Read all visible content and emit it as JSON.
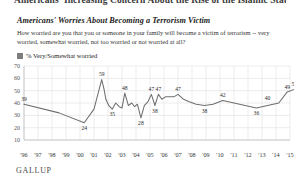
{
  "article": {
    "headline": "Americans' Increasing Concern About the Rise of the Islamic State"
  },
  "chart_header": {
    "title": "Americans' Worries About Becoming a Terrorism Victim",
    "subtitle": "How worried are you that you or someone in your family will become a victim of terrorism -- very worried, somewhat worried, not too worried or not worried at all?",
    "legend_label": "% Very/Somewhat worried",
    "legend_color": "#7d7d7d"
  },
  "footer": {
    "brand": "GALLUP"
  },
  "chart_data": {
    "type": "line",
    "title": "Americans' Worries About Becoming a Terrorism Victim",
    "subtitle": "How worried are you that you or someone in your family will become a victim of terrorism -- very worried, somewhat worried, not too worried or not worried at all?",
    "xlabel": "",
    "ylabel": "",
    "ylim": [
      10,
      70
    ],
    "yticks": [
      10,
      20,
      30,
      40,
      50,
      60,
      70
    ],
    "xlim": [
      1996,
      2015
    ],
    "xticks": [
      "'96",
      "'97",
      "'98",
      "'99",
      "'00",
      "'01",
      "'02",
      "'03",
      "'04",
      "'05",
      "'06",
      "'07",
      "'08",
      "'09",
      "'10",
      "'11",
      "'12",
      "'13",
      "'14",
      "'15"
    ],
    "grid": true,
    "legend_position": "top-left",
    "series": [
      {
        "name": "% Very/Somewhat worried",
        "color": "#6f6f6f",
        "x": [
          1996.0,
          1998.5,
          2000.3,
          2001.0,
          2001.55,
          2001.72,
          2001.85,
          2002.05,
          2002.3,
          2002.55,
          2002.8,
          2003.0,
          2003.2,
          2003.45,
          2003.7,
          2003.9,
          2004.1,
          2004.35,
          2004.6,
          2004.85,
          2005.1,
          2005.35,
          2005.6,
          2005.85,
          2006.1,
          2006.4,
          2006.7,
          2007.0,
          2007.4,
          2007.8,
          2008.3,
          2008.9,
          2009.5,
          2010.2,
          2011.0,
          2011.8,
          2012.6,
          2013.4,
          2014.2,
          2014.8,
          2015.3
        ],
        "values": [
          39,
          32,
          24,
          35,
          59,
          51,
          43,
          38,
          35,
          40,
          37,
          36,
          48,
          38,
          40,
          37,
          39,
          28,
          38,
          41,
          47,
          38,
          47,
          43,
          45,
          45,
          45,
          47,
          43,
          41,
          39,
          38,
          39,
          42,
          40,
          38,
          36,
          38,
          40,
          49,
          51
        ]
      }
    ],
    "point_labels": [
      {
        "x": 1996.0,
        "value": 39,
        "text": "39",
        "pos": "above"
      },
      {
        "x": 2000.3,
        "value": 24,
        "text": "24",
        "pos": "below"
      },
      {
        "x": 2001.55,
        "value": 59,
        "text": "59",
        "pos": "above"
      },
      {
        "x": 2002.3,
        "value": 35,
        "text": "35",
        "pos": "below"
      },
      {
        "x": 2003.2,
        "value": 48,
        "text": "48",
        "pos": "above"
      },
      {
        "x": 2004.35,
        "value": 28,
        "text": "28",
        "pos": "below"
      },
      {
        "x": 2005.1,
        "value": 47,
        "text": "47",
        "pos": "above"
      },
      {
        "x": 2005.6,
        "value": 47,
        "text": "47",
        "pos": "above"
      },
      {
        "x": 2005.35,
        "value": 38,
        "text": "38",
        "pos": "below"
      },
      {
        "x": 2007.0,
        "value": 47,
        "text": "47",
        "pos": "above"
      },
      {
        "x": 2008.9,
        "value": 38,
        "text": "38",
        "pos": "below"
      },
      {
        "x": 2010.2,
        "value": 42,
        "text": "42",
        "pos": "above"
      },
      {
        "x": 2012.6,
        "value": 36,
        "text": "36",
        "pos": "below"
      },
      {
        "x": 2013.4,
        "value": 40,
        "text": "40",
        "pos": "above"
      },
      {
        "x": 2014.8,
        "value": 49,
        "text": "49",
        "pos": "above"
      },
      {
        "x": 2015.3,
        "value": 51,
        "text": "51",
        "pos": "above"
      }
    ]
  }
}
